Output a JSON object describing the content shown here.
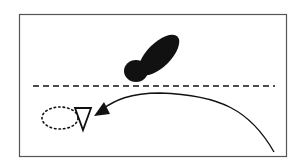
{
  "diagram": {
    "colors": {
      "ink": "#111111",
      "frame": "#555555",
      "background": "#ffffff"
    },
    "frame": {
      "x": 19,
      "y": 14,
      "width": 267,
      "height": 142
    },
    "dashed_line": {
      "x1": 33,
      "y1": 86,
      "x2": 275,
      "y2": 86
    },
    "blob": {
      "large": {
        "cx": 159,
        "cy": 55,
        "rx": 12,
        "ry": 26,
        "rotate": 45
      },
      "small": {
        "cx": 136,
        "cy": 71,
        "rx": 12,
        "ry": 11
      }
    },
    "triangle": {
      "points": "75,108 91,108 83,130"
    },
    "dotted_ellipse": {
      "cx": 60,
      "cy": 118,
      "rx": 18,
      "ry": 11
    },
    "curve": {
      "path": "M274,152 C250,110 220,95 160,93 C130,93 115,100 101,110"
    },
    "arrowhead": {
      "points": "94,116 106,103 108,116"
    }
  }
}
